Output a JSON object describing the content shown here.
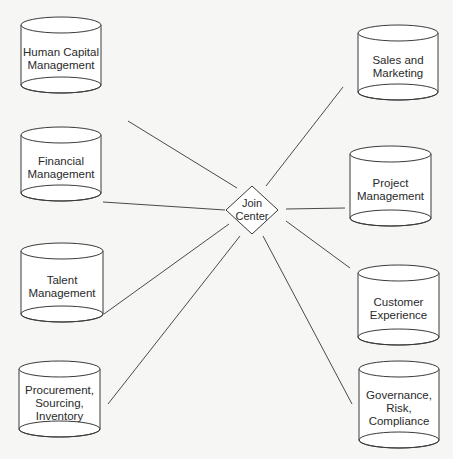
{
  "diagram": {
    "hub": {
      "label": "Join\nCenter",
      "cx": 252,
      "cy": 210,
      "rx": 26,
      "ry": 24
    },
    "nodes": [
      {
        "id": "human-capital",
        "label": "Human Capital\nManagement",
        "x": 21,
        "y": 17,
        "w": 80,
        "h": 76,
        "anchor": [
          128,
          121
        ]
      },
      {
        "id": "financial",
        "label": "Financial\nManagement",
        "x": 21,
        "y": 127,
        "w": 80,
        "h": 74,
        "anchor": [
          103,
          202
        ]
      },
      {
        "id": "talent",
        "label": "Talent\nManagement",
        "x": 21,
        "y": 243,
        "w": 82,
        "h": 79,
        "anchor": [
          104,
          314
        ]
      },
      {
        "id": "procurement",
        "label": "Procurement,\nSourcing,\nInventory",
        "x": 19,
        "y": 361,
        "w": 81,
        "h": 76,
        "anchor": [
          108,
          404
        ]
      },
      {
        "id": "sales",
        "label": "Sales and\nMarketing",
        "x": 358,
        "y": 25,
        "w": 80,
        "h": 75,
        "anchor": [
          343,
          87
        ]
      },
      {
        "id": "project",
        "label": "Project\nManagement",
        "x": 350,
        "y": 146,
        "w": 81,
        "h": 80,
        "anchor": [
          345,
          208
        ]
      },
      {
        "id": "customer",
        "label": "Customer\nExperience",
        "x": 358,
        "y": 265,
        "w": 81,
        "h": 80,
        "anchor": [
          350,
          268
        ]
      },
      {
        "id": "governance",
        "label": "Governance,\nRisk,\nCompliance",
        "x": 359,
        "y": 361,
        "w": 80,
        "h": 87,
        "anchor": [
          352,
          404
        ]
      }
    ],
    "hub_anchors": {
      "human-capital": [
        237,
        188
      ],
      "financial": [
        225,
        210
      ],
      "talent": [
        229,
        224
      ],
      "procurement": [
        240,
        236
      ],
      "sales": [
        266,
        186
      ],
      "project": [
        286,
        209
      ],
      "customer": [
        286,
        221
      ],
      "governance": [
        263,
        236
      ]
    },
    "colors": {
      "stroke": "#3a3a3a",
      "fill": "#ffffff",
      "line": "#4a4a4a",
      "background": "#f6f6f4"
    }
  }
}
